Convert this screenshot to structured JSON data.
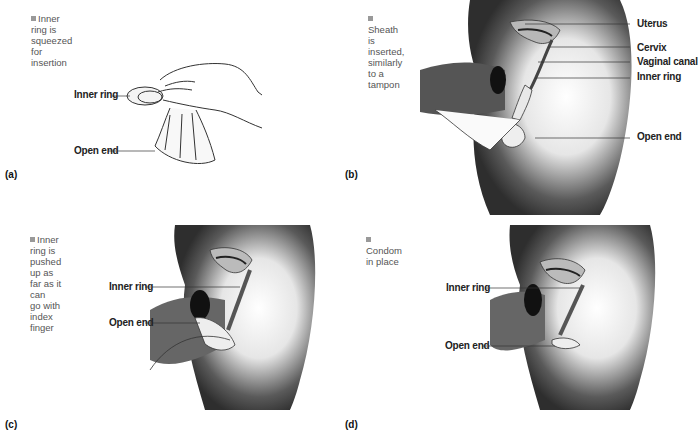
{
  "figure": {
    "panels": [
      {
        "id": "a",
        "panel_label": "(a)",
        "note": "Inner ring is squeezed for insertion",
        "note_lines": [
          "Inner ring is",
          "squeezed for",
          "insertion"
        ],
        "labels": [
          "Inner ring",
          "Open end"
        ]
      },
      {
        "id": "b",
        "panel_label": "(b)",
        "note": "Sheath is inserted, similarly to a tampon",
        "note_lines": [
          "Sheath is inserted,",
          "similarly to a",
          "tampon"
        ],
        "labels": [
          "Uterus",
          "Cervix",
          "Vaginal canal",
          "Inner ring",
          "Open end"
        ]
      },
      {
        "id": "c",
        "panel_label": "(c)",
        "note": "Inner ring is pushed up as far as it can go with index finger",
        "note_lines": [
          "Inner ring is pushed",
          "up as far as it can",
          "go with index finger"
        ],
        "labels": [
          "Inner ring",
          "Open end"
        ]
      },
      {
        "id": "d",
        "panel_label": "(d)",
        "note": "Condom in place",
        "note_lines": [
          "Condom in place"
        ],
        "labels": [
          "Inner ring",
          "Open end"
        ]
      }
    ],
    "colors": {
      "bullet": "#999999",
      "note_text": "#555555",
      "label_text": "#222222",
      "shading_dark": "#3a3a3a",
      "leader_line": "#333333"
    }
  }
}
